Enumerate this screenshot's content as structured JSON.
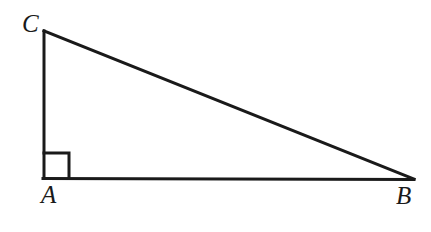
{
  "figure": {
    "type": "geometry-diagram",
    "background_color": "#ffffff",
    "stroke_color": "#1a1a1a",
    "label_color": "#1a1a1a",
    "stroke_width": 3,
    "width": 431,
    "height": 232
  },
  "labels": {
    "vertex_c": "C",
    "vertex_a": "A",
    "vertex_b": "B"
  },
  "geometry": {
    "vertices": {
      "A": {
        "x": 44,
        "y": 178
      },
      "B": {
        "x": 414,
        "y": 179
      },
      "C": {
        "x": 44,
        "y": 31
      }
    },
    "segments": [
      {
        "name": "leg-CA",
        "from": "C",
        "to": "A"
      },
      {
        "name": "base-AB",
        "from": "A",
        "to": "B"
      },
      {
        "name": "hypotenuse-CB",
        "from": "C",
        "to": "B"
      }
    ],
    "right_angle_marker": {
      "at_vertex": "A",
      "size": 25,
      "x": 44,
      "y": 153
    }
  }
}
